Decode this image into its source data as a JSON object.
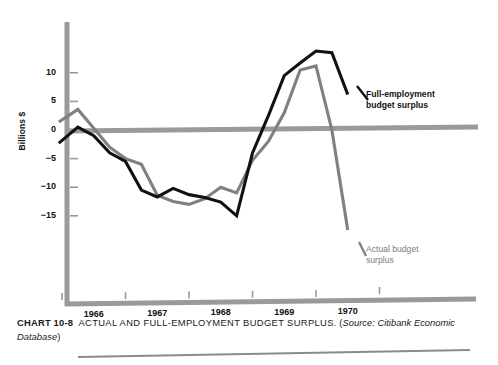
{
  "axis": {
    "ylabel": "Billions $",
    "yticks": [
      "10",
      "5",
      "0",
      "-5",
      "-10",
      "-15"
    ],
    "ytick_values": [
      10,
      5,
      0,
      -5,
      -10,
      -15
    ],
    "xticks": [
      "1966",
      "1967",
      "1968",
      "1969",
      "1970"
    ]
  },
  "labels": {
    "full_employment_line1": "Full-employment",
    "full_employment_line2": "budget surplus",
    "actual_line1": "Actual budget",
    "actual_line2": "surplus"
  },
  "caption": {
    "number": "CHART 10-8",
    "title": "ACTUAL AND FULL-EMPLOYMENT BUDGET SURPLUS.",
    "source_open": "(",
    "source_prefix": "Source:",
    "source_text": "Citibank Economic Database",
    "source_close": ")"
  },
  "colors": {
    "full_employment": "#111111",
    "actual": "#808080",
    "axis": "#9a9a9a",
    "zero_line": "#9a9a9a",
    "rule": "#8a8a8a",
    "background": "#ffffff"
  },
  "chart_data": {
    "type": "line",
    "title": "ACTUAL AND FULL-EMPLOYMENT BUDGET SURPLUS.",
    "xlabel": "",
    "ylabel": "Billions $",
    "xlim": [
      1965.9,
      1971.0
    ],
    "ylim": [
      -19.5,
      15.5
    ],
    "grid": false,
    "legend": "inline-annotations",
    "x": [
      1965.95,
      1966.25,
      1966.5,
      1966.75,
      1967.0,
      1967.25,
      1967.5,
      1967.75,
      1968.0,
      1968.25,
      1968.5,
      1968.75,
      1969.0,
      1969.25,
      1969.5,
      1969.75,
      1970.0,
      1970.25,
      1970.5
    ],
    "series": [
      {
        "name": "Full-employment budget surplus",
        "color": "#111111",
        "values": [
          -2.3,
          0.5,
          -1.0,
          -4.0,
          -5.5,
          -10.5,
          -11.7,
          -10.2,
          -11.3,
          -11.8,
          -12.6,
          -15.0,
          -4.0,
          2.5,
          9.5,
          11.7,
          13.8,
          13.5,
          6.2
        ]
      },
      {
        "name": "Actual budget surplus",
        "color": "#808080",
        "values": [
          1.4,
          3.6,
          0.3,
          -3.0,
          -5.0,
          -6.0,
          -11.4,
          -12.5,
          -13.0,
          -12.0,
          -10.0,
          -11.0,
          -5.3,
          -2.0,
          3.0,
          10.5,
          11.2,
          0.0,
          -17.5
        ]
      }
    ]
  }
}
